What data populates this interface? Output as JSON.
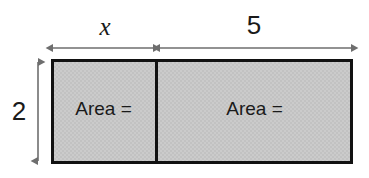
{
  "diagram": {
    "type": "area-model-rectangle",
    "background_color": "#ffffff",
    "fill_color": "#c9c9c9",
    "outline_color": "#111111",
    "arrow_color": "#6e6e6e",
    "text_color": "#1a1a1a",
    "dimension_labels": {
      "top_left": "x",
      "top_right": "5",
      "left_side": "2"
    },
    "regions": [
      {
        "name": "left-region",
        "label": "Area =",
        "width_label": "x",
        "height_label": "2"
      },
      {
        "name": "right-region",
        "label": "Area =",
        "width_label": "5",
        "height_label": "2"
      }
    ]
  }
}
